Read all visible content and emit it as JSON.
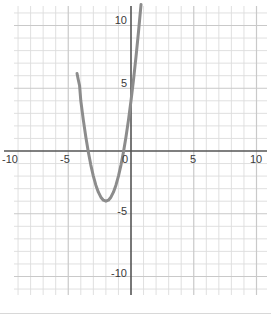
{
  "figure": {
    "title": "",
    "width": 271,
    "height": 314,
    "background": "#ffffff"
  },
  "axes": {
    "x_axis_label": "",
    "y_axis_label": "",
    "x_tick_labels": [
      "-10",
      "-5",
      "0",
      "5",
      "10"
    ],
    "x_tick_values": [
      -10,
      -5,
      0,
      5,
      10
    ],
    "y_tick_labels": [
      "10",
      "5",
      "-5",
      "-10"
    ],
    "y_tick_values": [
      10,
      5,
      -5,
      -10
    ],
    "origin_label": "0",
    "axis_color": "#555555",
    "grid_color": "#c9c9c9",
    "minor_grid_color": "#dcdcdc",
    "tick_text_color": "#3a3a3a"
  },
  "curve": {
    "color": "#8c8c8c",
    "width": 3,
    "label": "",
    "equation": "y = 2x^2 + 8x + 4"
  },
  "chart_data": {
    "type": "line",
    "title": "",
    "xlabel": "",
    "ylabel": "",
    "xlim": [
      -11,
      11
    ],
    "ylim": [
      -11.5,
      11.5
    ],
    "grid": true,
    "legend": "none",
    "xticks": [
      -10,
      -5,
      0,
      5,
      10
    ],
    "yticks": [
      10,
      5,
      -5,
      -10
    ],
    "xtick_labels": [
      "-10",
      "-5",
      "0",
      "5",
      "10"
    ],
    "ytick_labels": [
      "10",
      "5",
      "-5",
      "-10"
    ],
    "minor_grid_step": 1,
    "major_grid_step": 5,
    "series": [
      {
        "name": "parabola",
        "equation": "y = 2x^2 + 8x + 4",
        "color": "#8c8c8c",
        "vertex": [
          -2,
          -4
        ],
        "roots": [
          -3.41,
          -0.59
        ],
        "y_intercept": 4,
        "x": [
          -4.3,
          -4.2,
          -4.1,
          -4.0,
          -3.8,
          -3.6,
          -3.4,
          -3.2,
          -3.0,
          -2.8,
          -2.6,
          -2.4,
          -2.2,
          -2.0,
          -1.8,
          -1.6,
          -1.4,
          -1.2,
          -1.0,
          -0.8,
          -0.6,
          -0.4,
          -0.2,
          0.0,
          0.2,
          0.4,
          0.6,
          0.8,
          1.0,
          1.2,
          1.3
        ],
        "y": [
          6.18,
          5.68,
          5.22,
          4.0,
          2.48,
          1.12,
          -0.08,
          -1.12,
          -2.0,
          -2.72,
          -3.28,
          -3.68,
          -3.92,
          -4.0,
          -3.92,
          -3.68,
          -3.28,
          -2.72,
          -2.0,
          -1.12,
          -0.08,
          1.12,
          2.48,
          4.0,
          5.68,
          7.52,
          9.52,
          11.68,
          14.0,
          16.48,
          17.78
        ]
      }
    ]
  }
}
